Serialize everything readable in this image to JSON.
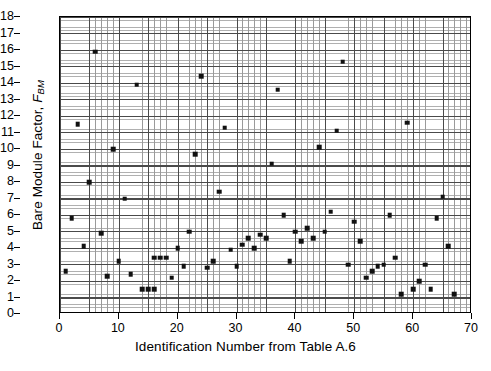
{
  "figure": {
    "xlabel": "Identification Number from Table A.6",
    "ylabel_main": "Bare Module Factor,",
    "ylabel_symbol": "F",
    "ylabel_subscript": "BM"
  },
  "chart_data": {
    "type": "scatter",
    "title": "",
    "xlabel": "Identification Number from Table A.6",
    "ylabel": "Bare Module Factor, F_BM",
    "xlim": [
      0,
      70
    ],
    "ylim": [
      0,
      18
    ],
    "xticks": [
      0,
      10,
      20,
      30,
      40,
      50,
      60,
      70
    ],
    "yticks": [
      0,
      1,
      2,
      3,
      4,
      5,
      6,
      7,
      8,
      9,
      10,
      11,
      12,
      13,
      14,
      15,
      16,
      17,
      18
    ],
    "x_minor_step": 1,
    "y_minor_step": 0.2,
    "grid": true,
    "legend": false,
    "marker": "square",
    "marker_color": "#111111",
    "points": [
      {
        "x": 1,
        "y": 2.6
      },
      {
        "x": 2,
        "y": 5.8
      },
      {
        "x": 3,
        "y": 11.5
      },
      {
        "x": 4,
        "y": 4.1
      },
      {
        "x": 5,
        "y": 8.0
      },
      {
        "x": 6,
        "y": 15.9
      },
      {
        "x": 7,
        "y": 4.9
      },
      {
        "x": 8,
        "y": 2.3
      },
      {
        "x": 9,
        "y": 10.0
      },
      {
        "x": 10,
        "y": 3.2
      },
      {
        "x": 11,
        "y": 7.0
      },
      {
        "x": 12,
        "y": 2.4
      },
      {
        "x": 13,
        "y": 13.9
      },
      {
        "x": 14,
        "y": 1.5
      },
      {
        "x": 15,
        "y": 1.5
      },
      {
        "x": 16,
        "y": 1.5
      },
      {
        "x": 16,
        "y": 3.4
      },
      {
        "x": 17,
        "y": 3.4
      },
      {
        "x": 18,
        "y": 3.4
      },
      {
        "x": 19,
        "y": 2.2
      },
      {
        "x": 20,
        "y": 4.0
      },
      {
        "x": 21,
        "y": 2.9
      },
      {
        "x": 22,
        "y": 5.0
      },
      {
        "x": 23,
        "y": 9.7
      },
      {
        "x": 24,
        "y": 14.4
      },
      {
        "x": 25,
        "y": 2.8
      },
      {
        "x": 26,
        "y": 3.2
      },
      {
        "x": 27,
        "y": 7.4
      },
      {
        "x": 28,
        "y": 11.3
      },
      {
        "x": 29,
        "y": 3.9
      },
      {
        "x": 30,
        "y": 2.9
      },
      {
        "x": 31,
        "y": 4.2
      },
      {
        "x": 32,
        "y": 4.6
      },
      {
        "x": 33,
        "y": 4.0
      },
      {
        "x": 34,
        "y": 4.8
      },
      {
        "x": 35,
        "y": 4.6
      },
      {
        "x": 36,
        "y": 9.1
      },
      {
        "x": 37,
        "y": 13.6
      },
      {
        "x": 38,
        "y": 6.0
      },
      {
        "x": 39,
        "y": 3.2
      },
      {
        "x": 40,
        "y": 5.0
      },
      {
        "x": 41,
        "y": 4.4
      },
      {
        "x": 42,
        "y": 5.2
      },
      {
        "x": 43,
        "y": 4.6
      },
      {
        "x": 44,
        "y": 10.1
      },
      {
        "x": 45,
        "y": 5.0
      },
      {
        "x": 46,
        "y": 6.2
      },
      {
        "x": 47,
        "y": 11.1
      },
      {
        "x": 48,
        "y": 15.3
      },
      {
        "x": 49,
        "y": 3.0
      },
      {
        "x": 50,
        "y": 5.6
      },
      {
        "x": 51,
        "y": 4.4
      },
      {
        "x": 52,
        "y": 2.2
      },
      {
        "x": 53,
        "y": 2.6
      },
      {
        "x": 54,
        "y": 2.9
      },
      {
        "x": 55,
        "y": 3.0
      },
      {
        "x": 56,
        "y": 6.0
      },
      {
        "x": 57,
        "y": 3.4
      },
      {
        "x": 58,
        "y": 1.2
      },
      {
        "x": 59,
        "y": 11.6
      },
      {
        "x": 60,
        "y": 1.5
      },
      {
        "x": 61,
        "y": 2.0
      },
      {
        "x": 62,
        "y": 3.0
      },
      {
        "x": 63,
        "y": 1.5
      },
      {
        "x": 64,
        "y": 5.8
      },
      {
        "x": 65,
        "y": 7.1
      },
      {
        "x": 66,
        "y": 4.1
      },
      {
        "x": 67,
        "y": 1.2
      }
    ]
  }
}
